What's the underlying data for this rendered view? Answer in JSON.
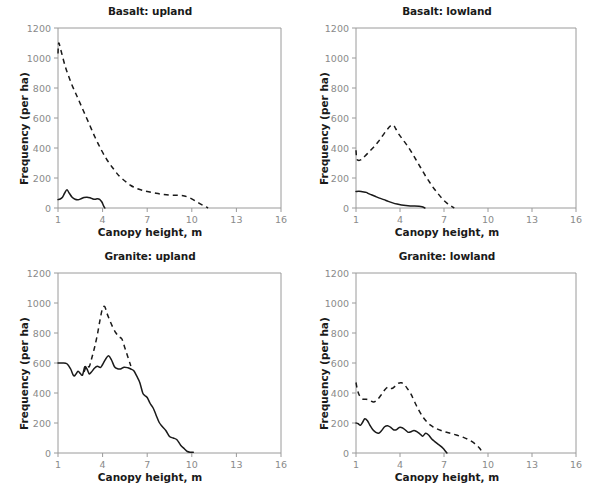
{
  "figure": {
    "panel_count": 4,
    "xlabel": "Canopy height, m",
    "ylabel": "Frequency (per ha)",
    "line_color": "#1a1a1a",
    "axis_color": "#9a9a9a",
    "tick_label_color": "#8a8a8a",
    "background": "#ffffff"
  },
  "chart_data": [
    {
      "type": "line",
      "title": "Basalt: upland",
      "xlabel": "Canopy height, m",
      "ylabel": "Frequency (per ha)",
      "xlim": [
        1,
        16
      ],
      "ylim": [
        0,
        1200
      ],
      "xticks": [
        1,
        4,
        7,
        10,
        13,
        16
      ],
      "yticks": [
        0,
        200,
        400,
        600,
        800,
        1000,
        1200
      ],
      "grid": false,
      "legend": "none",
      "series": [
        {
          "name": "dashed",
          "style": "dashed",
          "x": [
            1.0,
            1.05,
            1.2,
            1.5,
            1.9,
            2.3,
            2.7,
            3.1,
            3.5,
            3.9,
            4.3,
            4.7,
            5.1,
            5.5,
            5.9,
            6.3,
            6.7,
            7.1,
            7.6,
            8.1,
            8.6,
            9.1,
            9.5,
            9.9,
            10.3,
            10.6,
            10.9,
            11.1
          ],
          "y": [
            1030,
            1100,
            1050,
            940,
            830,
            740,
            650,
            560,
            470,
            390,
            320,
            265,
            215,
            180,
            150,
            130,
            118,
            108,
            98,
            90,
            85,
            84,
            80,
            66,
            44,
            26,
            10,
            0
          ]
        },
        {
          "name": "solid",
          "style": "solid",
          "x": [
            1.0,
            1.15,
            1.3,
            1.45,
            1.6,
            1.75,
            1.95,
            2.15,
            2.35,
            2.55,
            2.75,
            2.95,
            3.15,
            3.35,
            3.5,
            3.65,
            3.8,
            3.95,
            4.05,
            4.15
          ],
          "y": [
            56,
            60,
            72,
            100,
            122,
            100,
            72,
            58,
            55,
            62,
            70,
            72,
            68,
            60,
            58,
            62,
            58,
            40,
            18,
            0
          ]
        }
      ]
    },
    {
      "type": "line",
      "title": "Basalt: lowland",
      "xlabel": "Canopy height, m",
      "ylabel": "Frequency (per ha)",
      "xlim": [
        1,
        16
      ],
      "ylim": [
        0,
        1200
      ],
      "xticks": [
        1,
        4,
        7,
        10,
        13,
        16
      ],
      "yticks": [
        0,
        200,
        400,
        600,
        800,
        1000,
        1200
      ],
      "grid": false,
      "legend": "none",
      "series": [
        {
          "name": "dashed",
          "style": "dashed",
          "x": [
            1.0,
            1.05,
            1.15,
            1.35,
            1.6,
            1.9,
            2.2,
            2.5,
            2.8,
            3.1,
            3.35,
            3.55,
            3.7,
            3.9,
            4.2,
            4.5,
            4.8,
            5.1,
            5.4,
            5.7,
            6.0,
            6.3,
            6.6,
            6.9,
            7.2,
            7.5,
            7.7
          ],
          "y": [
            385,
            330,
            318,
            322,
            345,
            375,
            405,
            440,
            480,
            520,
            548,
            552,
            530,
            495,
            455,
            415,
            370,
            320,
            270,
            220,
            175,
            132,
            95,
            60,
            32,
            12,
            0
          ]
        },
        {
          "name": "solid",
          "style": "solid",
          "x": [
            1.0,
            1.2,
            1.45,
            1.7,
            1.85,
            2.05,
            2.3,
            2.6,
            2.9,
            3.2,
            3.5,
            3.8,
            4.1,
            4.4,
            4.7,
            5.0,
            5.3,
            5.5,
            5.7
          ],
          "y": [
            110,
            112,
            108,
            104,
            96,
            88,
            78,
            66,
            56,
            44,
            34,
            26,
            20,
            16,
            14,
            14,
            12,
            8,
            0
          ]
        }
      ]
    },
    {
      "type": "line",
      "title": "Granite: upland",
      "xlabel": "Canopy height, m",
      "ylabel": "Frequency (per ha)",
      "xlim": [
        1,
        16
      ],
      "ylim": [
        0,
        1200
      ],
      "xticks": [
        1,
        4,
        7,
        10,
        13,
        16
      ],
      "yticks": [
        0,
        200,
        400,
        600,
        800,
        1000,
        1200
      ],
      "grid": false,
      "legend": "none",
      "series": [
        {
          "name": "dashed",
          "style": "dashed",
          "x": [
            2.75,
            2.95,
            3.1,
            3.25,
            3.45,
            3.65,
            3.85,
            4.0,
            4.15,
            4.3,
            4.5,
            4.7,
            4.9,
            5.1,
            5.3,
            5.5,
            5.7,
            5.9
          ],
          "y": [
            540,
            585,
            575,
            625,
            700,
            790,
            900,
            965,
            975,
            930,
            880,
            835,
            800,
            775,
            760,
            700,
            640,
            580
          ]
        },
        {
          "name": "solid",
          "style": "solid",
          "x": [
            1.0,
            1.3,
            1.6,
            1.85,
            2.05,
            2.2,
            2.35,
            2.5,
            2.65,
            2.8,
            2.95,
            3.1,
            3.25,
            3.45,
            3.65,
            3.85,
            4.0,
            4.2,
            4.4,
            4.6,
            4.8,
            5.0,
            5.2,
            5.45,
            5.7,
            5.9,
            6.1,
            6.3,
            6.5,
            6.7,
            6.85,
            7.0,
            7.2,
            7.4,
            7.6,
            7.8,
            8.0,
            8.25,
            8.5,
            8.75,
            9.0,
            9.25,
            9.5,
            9.7,
            9.9,
            10.1
          ],
          "y": [
            600,
            600,
            595,
            560,
            515,
            525,
            545,
            530,
            520,
            575,
            560,
            528,
            540,
            565,
            578,
            570,
            590,
            625,
            648,
            620,
            575,
            562,
            560,
            572,
            568,
            560,
            548,
            512,
            470,
            400,
            382,
            370,
            330,
            300,
            252,
            205,
            178,
            150,
            110,
            100,
            88,
            52,
            28,
            10,
            5,
            5
          ]
        }
      ]
    },
    {
      "type": "line",
      "title": "Granite: lowland",
      "xlabel": "Canopy height, m",
      "ylabel": "Frequency (per ha)",
      "xlim": [
        1,
        16
      ],
      "ylim": [
        0,
        1200
      ],
      "xticks": [
        1,
        4,
        7,
        10,
        13,
        16
      ],
      "yticks": [
        0,
        200,
        400,
        600,
        800,
        1000,
        1200
      ],
      "grid": false,
      "legend": "none",
      "series": [
        {
          "name": "dashed",
          "style": "dashed",
          "x": [
            1.0,
            1.1,
            1.25,
            1.45,
            1.7,
            1.95,
            2.2,
            2.45,
            2.7,
            2.95,
            3.2,
            3.45,
            3.7,
            3.9,
            4.1,
            4.3,
            4.5,
            4.75,
            5.0,
            5.3,
            5.6,
            5.9,
            6.2,
            6.5,
            6.8,
            7.1,
            7.5,
            7.9,
            8.3,
            8.7,
            9.1,
            9.4,
            9.65
          ],
          "y": [
            470,
            420,
            380,
            360,
            358,
            350,
            340,
            355,
            385,
            420,
            440,
            430,
            448,
            465,
            468,
            455,
            430,
            392,
            340,
            282,
            235,
            200,
            178,
            162,
            150,
            140,
            130,
            118,
            105,
            88,
            62,
            35,
            0
          ]
        },
        {
          "name": "solid",
          "style": "solid",
          "x": [
            1.0,
            1.15,
            1.3,
            1.45,
            1.6,
            1.78,
            1.95,
            2.15,
            2.35,
            2.55,
            2.75,
            2.95,
            3.15,
            3.35,
            3.55,
            3.75,
            3.95,
            4.15,
            4.35,
            4.55,
            4.75,
            4.95,
            5.15,
            5.35,
            5.55,
            5.75,
            5.95,
            6.15,
            6.35,
            6.55,
            6.75,
            6.95,
            7.1,
            7.2
          ],
          "y": [
            200,
            195,
            185,
            205,
            228,
            215,
            185,
            155,
            138,
            132,
            150,
            175,
            182,
            172,
            155,
            155,
            170,
            168,
            155,
            138,
            142,
            150,
            142,
            128,
            112,
            132,
            120,
            95,
            78,
            62,
            48,
            30,
            12,
            0
          ]
        }
      ]
    }
  ],
  "panels": [
    {
      "title": "Basalt: upland",
      "xlabel": "Canopy height, m",
      "ylabel": "Frequency (per ha)"
    },
    {
      "title": "Basalt: lowland",
      "xlabel": "Canopy height, m",
      "ylabel": "Frequency (per ha)"
    },
    {
      "title": "Granite: upland",
      "xlabel": "Canopy height, m",
      "ylabel": "Frequency (per ha)"
    },
    {
      "title": "Granite: lowland",
      "xlabel": "Canopy height, m",
      "ylabel": "Frequency (per ha)"
    }
  ]
}
